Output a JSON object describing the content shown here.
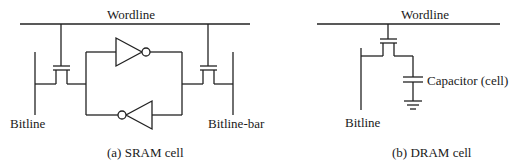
{
  "sram": {
    "wordline_label": "Wordline",
    "bitline_label": "Bitline",
    "bitline_bar_label": "Bitline-bar",
    "caption": "(a) SRAM cell"
  },
  "dram": {
    "wordline_label": "Wordline",
    "bitline_label": "Bitline",
    "capacitor_label": "Capacitor (cell)",
    "caption": "(b) DRAM cell"
  }
}
